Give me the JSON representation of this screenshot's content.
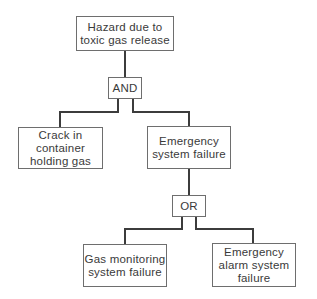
{
  "diagram": {
    "type": "fault-tree",
    "top_event": {
      "label": "Hazard due to\ntoxic gas release"
    },
    "gates": [
      {
        "id": "and",
        "label": "AND"
      },
      {
        "id": "or",
        "label": "OR"
      }
    ],
    "events": [
      {
        "id": "crack",
        "label": "Crack in\ncontainer\nholding gas"
      },
      {
        "id": "emergency",
        "label": "Emergency\nsystem failure"
      },
      {
        "id": "gas-monitoring",
        "label": "Gas monitoring\nsystem failure"
      },
      {
        "id": "alarm",
        "label": "Emergency\nalarm system\nfailure"
      }
    ],
    "edges": [
      [
        "top_event",
        "and"
      ],
      [
        "and",
        "crack"
      ],
      [
        "and",
        "emergency"
      ],
      [
        "emergency",
        "or"
      ],
      [
        "or",
        "gas-monitoring"
      ],
      [
        "or",
        "alarm"
      ]
    ]
  }
}
